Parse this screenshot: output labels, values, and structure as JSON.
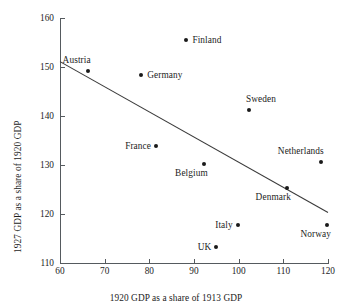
{
  "chart_data": {
    "type": "scatter",
    "title": "",
    "xlabel": "1920 GDP as a share of 1913 GDP",
    "ylabel": "1927 GDP as a share of 1920 GDP",
    "xlim": [
      60,
      120
    ],
    "ylim": [
      110,
      160
    ],
    "xticks": [
      60,
      70,
      80,
      90,
      100,
      110,
      120
    ],
    "yticks": [
      110,
      120,
      130,
      140,
      150,
      160
    ],
    "xticklabels": [
      "60",
      "70",
      "80",
      "90",
      "100",
      "110",
      "120"
    ],
    "yticklabels": [
      "110",
      "120",
      "130",
      "140",
      "150",
      "160"
    ],
    "grid": false,
    "legend": false,
    "marker_color": "#1a1a1a",
    "line_color": "#3a3a3a",
    "points": [
      {
        "label": "Austria",
        "x": 66.2,
        "y": 149.2,
        "label_pos": "above-left"
      },
      {
        "label": "Finland",
        "x": 88.3,
        "y": 155.5,
        "label_pos": "right"
      },
      {
        "label": "Germany",
        "x": 78.2,
        "y": 148.3,
        "label_pos": "right"
      },
      {
        "label": "Sweden",
        "x": 102.3,
        "y": 141.2,
        "label_pos": "above-right"
      },
      {
        "label": "France",
        "x": 81.5,
        "y": 133.9,
        "label_pos": "left"
      },
      {
        "label": "Belgium",
        "x": 92.2,
        "y": 130.3,
        "label_pos": "below-left"
      },
      {
        "label": "Netherlands",
        "x": 118.4,
        "y": 130.7,
        "label_pos": "above-left"
      },
      {
        "label": "Denmark",
        "x": 110.8,
        "y": 125.3,
        "label_pos": "below-left"
      },
      {
        "label": "Italy",
        "x": 99.8,
        "y": 117.8,
        "label_pos": "left"
      },
      {
        "label": "Norway",
        "x": 119.8,
        "y": 117.7,
        "label_pos": "below-left"
      },
      {
        "label": "UK",
        "x": 95.0,
        "y": 113.3,
        "label_pos": "left"
      }
    ],
    "trendline": {
      "x_start": 60,
      "y_start": 151.1,
      "x_end": 120,
      "y_end": 120.3
    }
  }
}
